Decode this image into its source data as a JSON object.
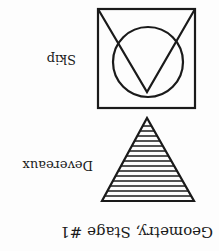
{
  "card": {
    "orientation": "rotated 180°",
    "title": "Geometry, Stage #1",
    "items": [
      {
        "label": "Devereaux",
        "shape": "triangle-icon",
        "fill": "horizontal-hatch"
      },
      {
        "label": "Skip",
        "shape": "square-circle-v-icon"
      }
    ]
  },
  "colors": {
    "ink": "#1a1a1a",
    "background": "#fdfdfd"
  }
}
